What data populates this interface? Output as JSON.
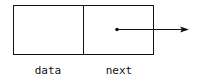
{
  "diagram": {
    "type": "linked-list-node",
    "fields": [
      {
        "name": "data",
        "label": "data"
      },
      {
        "name": "next",
        "label": "next",
        "pointer": true
      }
    ],
    "colors": {
      "stroke": "#111111",
      "background": "#ffffff"
    }
  }
}
